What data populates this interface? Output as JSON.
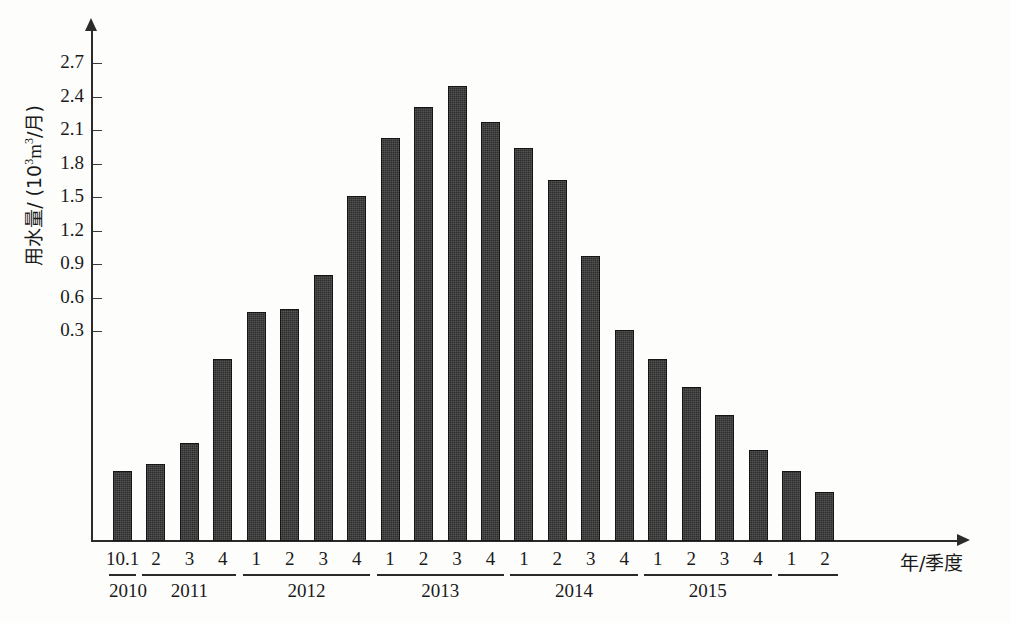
{
  "chart_data": {
    "type": "bar",
    "title": "",
    "subtitle": "",
    "xlabel": "年/季度",
    "ylabel": "用水量/ (10³m³/月)",
    "ylabel_parts": {
      "quantity": "用水量/ (10",
      "exponent": "3",
      "unit_mid": "m",
      "unit_exponent": "3",
      "unit_tail": "/月)"
    },
    "grid": false,
    "legend": null,
    "ylim": [
      0,
      2.85
    ],
    "yticks": [
      0.3,
      0.6,
      0.9,
      1.2,
      1.5,
      1.8,
      2.1,
      2.4,
      2.7
    ],
    "ytick_labels": [
      "0.3",
      "0.6",
      "0.9",
      "1.2",
      "1.5",
      "1.8",
      "2.1",
      "2.4",
      "2.7"
    ],
    "axis_note": "baseline drawn below 0.3 tick; low bars compressed",
    "bar_color": "#2c2c2c",
    "categories": [
      "10.1",
      "2",
      "3",
      "4",
      "1",
      "2",
      "3",
      "4",
      "1",
      "2",
      "3",
      "4",
      "1",
      "2",
      "3",
      "4",
      "1",
      "2",
      "3",
      "4",
      "1",
      "2"
    ],
    "values": [
      0.1,
      0.11,
      0.14,
      0.26,
      0.47,
      0.5,
      0.8,
      1.51,
      2.03,
      2.31,
      2.49,
      2.17,
      1.94,
      1.65,
      0.97,
      0.31,
      0.26,
      0.22,
      0.18,
      0.13,
      0.1,
      0.07
    ],
    "year_groups": [
      {
        "year": "2010",
        "quarters": [
          "10.1"
        ]
      },
      {
        "year": "2011",
        "quarters": [
          "2",
          "3",
          "4"
        ]
      },
      {
        "year": "2012",
        "quarters": [
          "1",
          "2",
          "3",
          "4"
        ]
      },
      {
        "year": "2013",
        "quarters": [
          "1",
          "2",
          "3",
          "4"
        ]
      },
      {
        "year": "2014",
        "quarters": [
          "1",
          "2",
          "3",
          "4"
        ]
      },
      {
        "year": "2015",
        "quarters": [
          "1",
          "2",
          "3",
          "4"
        ]
      },
      {
        "year": "",
        "quarters": [
          "1",
          "2"
        ]
      }
    ],
    "x_tick_text": [
      "10.1",
      "2",
      "3",
      "4",
      "1",
      "2",
      "3",
      "4",
      "1",
      "2",
      "3",
      "4",
      "1",
      "2",
      "3",
      "4",
      "1",
      "2",
      "3",
      "4",
      "1",
      "2"
    ],
    "year_tick_text": [
      "2010",
      "2011",
      "2012",
      "2013",
      "2014",
      "2015"
    ]
  }
}
